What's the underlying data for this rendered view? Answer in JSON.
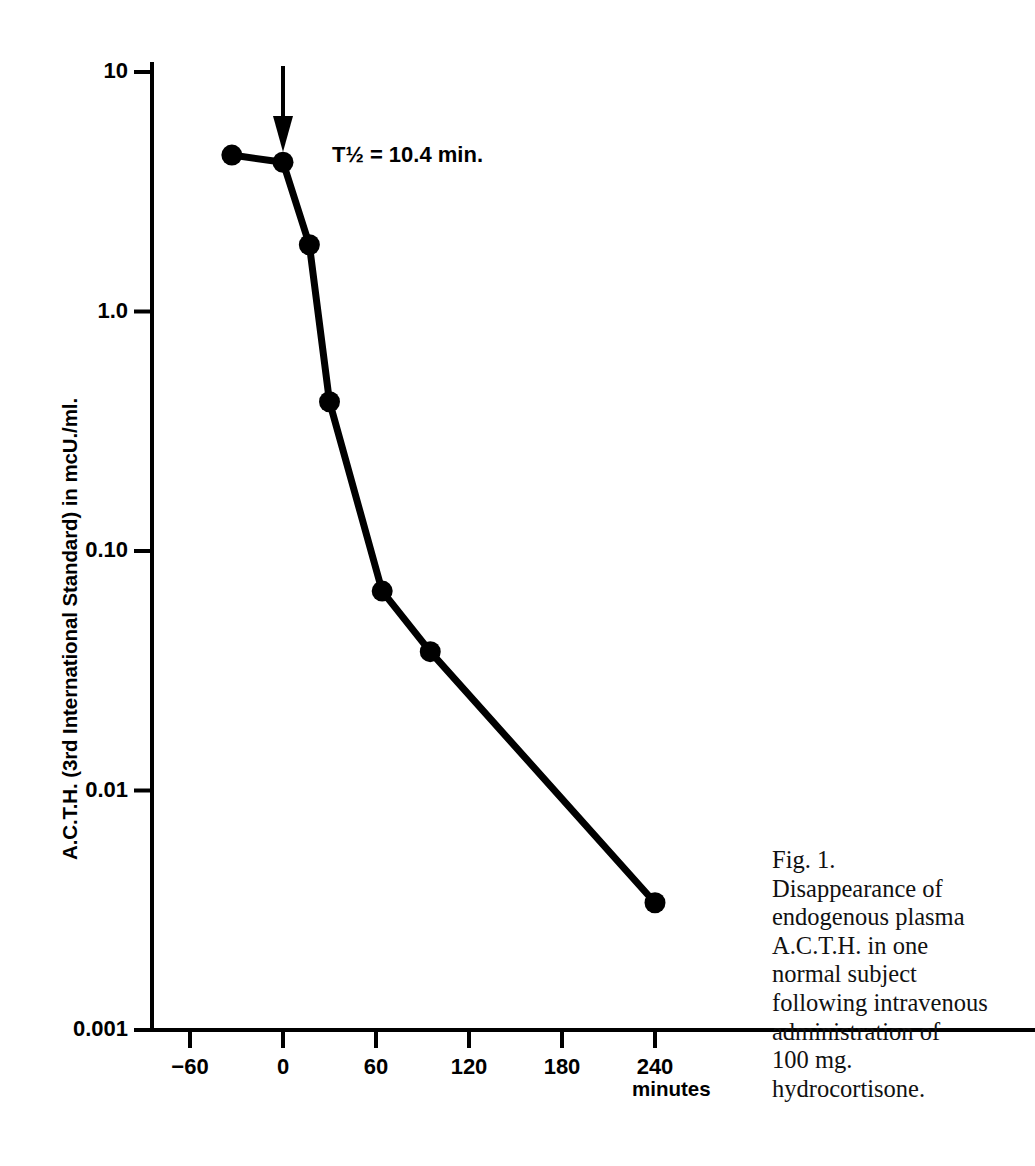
{
  "figure": {
    "caption_lines": [
      "Fig. 1.",
      "Disappearance of",
      "endogenous plasma",
      "A.C.T.H. in one",
      "normal subject",
      "following intravenous",
      "administration of",
      "100 mg.",
      "hydrocortisone."
    ],
    "minutes_label": "minutes"
  },
  "chart_data": {
    "type": "line",
    "title": "",
    "xlabel": "minutes",
    "ylabel": "A.C.T.H. (3rd International Standard) in mcU./ml.",
    "annotation": "T½ = 10.4 min.",
    "arrow_at_x": 0,
    "arrow_note": "injection marker arrow at time 0",
    "yscale": "log",
    "ylim": [
      0.001,
      10
    ],
    "xlim": [
      -90,
      270
    ],
    "grid": false,
    "legend": false,
    "marker": "filled-circle",
    "line_color": "#000000",
    "xticks": [
      -60,
      0,
      60,
      120,
      180,
      240
    ],
    "xtick_labels": [
      "−60",
      "0",
      "60",
      "120",
      "180",
      "240"
    ],
    "yticks": [
      10,
      1.0,
      0.1,
      0.01,
      0.001
    ],
    "ytick_labels": [
      "10",
      "1.0",
      "0.10",
      "0.01",
      "0.001"
    ],
    "x": [
      -33,
      0,
      17,
      30,
      64,
      95,
      240
    ],
    "values": [
      4.5,
      4.2,
      1.9,
      0.42,
      0.068,
      0.038,
      0.0034
    ],
    "points": [
      {
        "x": -33,
        "y": 4.5
      },
      {
        "x": 0,
        "y": 4.2
      },
      {
        "x": 17,
        "y": 1.9
      },
      {
        "x": 30,
        "y": 0.42
      },
      {
        "x": 64,
        "y": 0.068
      },
      {
        "x": 95,
        "y": 0.038
      },
      {
        "x": 240,
        "y": 0.0034
      }
    ]
  }
}
